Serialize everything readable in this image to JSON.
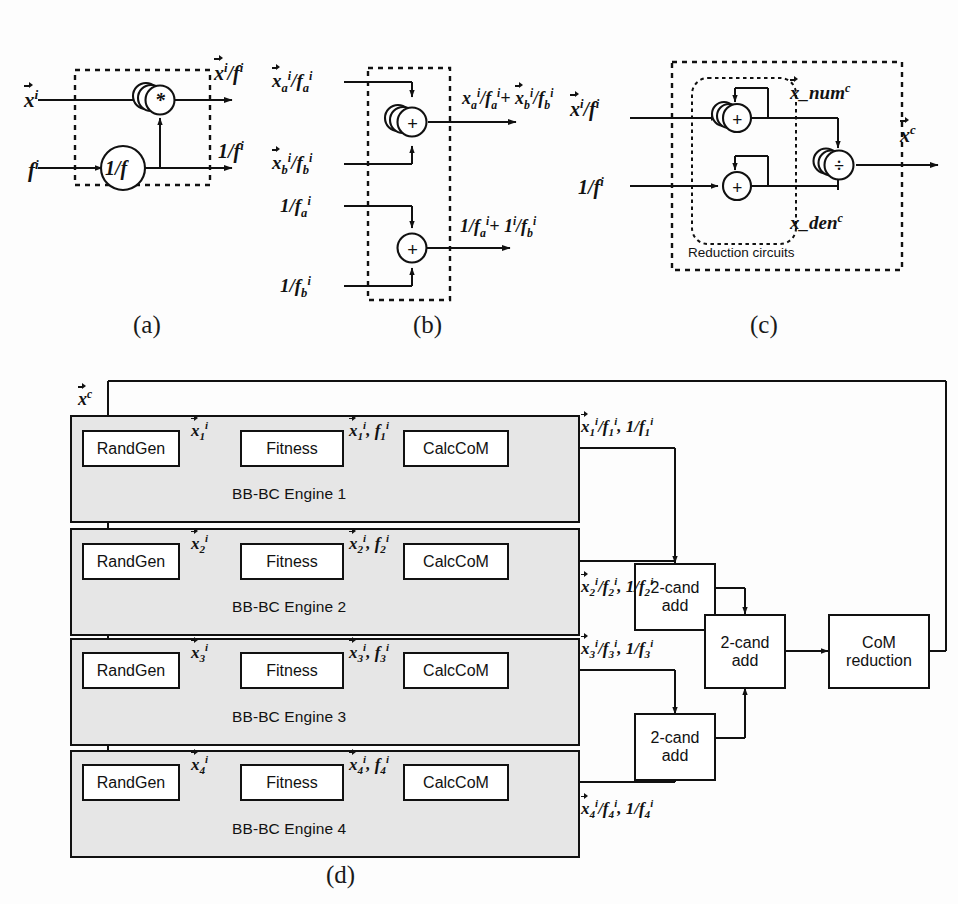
{
  "figure": {
    "panels": [
      {
        "id": "a",
        "caption": "(a)",
        "name": "calccom-unit",
        "inputs": [
          {
            "key": "x_i",
            "text": "x",
            "sup": "i",
            "vector": true
          },
          {
            "key": "f_i",
            "text": "f",
            "sup": "i",
            "vector": false
          }
        ],
        "outputs": [
          {
            "key": "x_over_f",
            "text": "x",
            "sup": "i",
            "suffix": "/f",
            "sup2": "i",
            "vector": true
          },
          {
            "key": "one_over_f",
            "text": "1/f",
            "sup": "i",
            "vector": false
          }
        ],
        "blocks": [
          {
            "key": "recip",
            "label": "1/f",
            "shape": "circle"
          },
          {
            "key": "mult",
            "label": "*",
            "shape": "stacked-circle"
          }
        ]
      },
      {
        "id": "b",
        "caption": "(b)",
        "name": "two-candidate-adder",
        "inputs": [
          {
            "key": "xa_fa",
            "label": "xa/fa"
          },
          {
            "key": "xb_fb",
            "label": "xb/fb"
          },
          {
            "key": "inv_fa",
            "label": "1/fa"
          },
          {
            "key": "inv_fb",
            "label": "1/fb"
          }
        ],
        "outputs": [
          {
            "key": "sum_num",
            "label": "xa/fa + xb/fb"
          },
          {
            "key": "sum_den",
            "label": "1/fa + 1/fb"
          }
        ],
        "blocks": [
          {
            "key": "add_num",
            "label": "+",
            "shape": "stacked-circle"
          },
          {
            "key": "add_den",
            "label": "+",
            "shape": "circle"
          }
        ]
      },
      {
        "id": "c",
        "caption": "(c)",
        "name": "com-reduction-unit",
        "inner_label": "Reduction circuits",
        "inputs": [
          {
            "key": "x_over_f",
            "label": "x/f"
          },
          {
            "key": "one_over_f",
            "label": "1/f"
          }
        ],
        "internal_labels": [
          {
            "key": "x_num",
            "text": "x_num",
            "sup": "c",
            "vector": true
          },
          {
            "key": "x_den",
            "text": "x_den",
            "sup": "c",
            "vector": false
          }
        ],
        "outputs": [
          {
            "key": "x_c",
            "text": "x",
            "sup": "c",
            "vector": true
          }
        ],
        "blocks": [
          {
            "key": "acc_num",
            "label": "+",
            "shape": "stacked-circle"
          },
          {
            "key": "acc_den",
            "label": "+",
            "shape": "circle"
          },
          {
            "key": "div",
            "label": "÷",
            "shape": "stacked-circle"
          }
        ]
      },
      {
        "id": "d",
        "caption": "(d)",
        "name": "parallel-bbbc-architecture",
        "feedback_label": {
          "text": "x",
          "sup": "c",
          "vector": true
        },
        "engines": [
          {
            "name": "BB-BC Engine 1",
            "stages": [
              "RandGen",
              "Fitness",
              "CalcCoM"
            ],
            "edge1": {
              "base": "x",
              "sub": "1",
              "sup": "i"
            },
            "edge2": {
              "base": "x",
              "sub": "1",
              "sup": "i",
              "second": "f",
              "sub2": "1",
              "sup2": "i"
            },
            "out": {
              "num": "x",
              "sub": "1",
              "sup": "i",
              "den": "f",
              "sup_den": "i",
              "inv": "1/f",
              "inv_sub": "1",
              "inv_sup": "i"
            }
          },
          {
            "name": "BB-BC Engine 2",
            "stages": [
              "RandGen",
              "Fitness",
              "CalcCoM"
            ],
            "edge1": {
              "base": "x",
              "sub": "2",
              "sup": "i"
            },
            "edge2": {
              "base": "x",
              "sub": "2",
              "sup": "i",
              "second": "f",
              "sub2": "2",
              "sup2": "i"
            },
            "out": {
              "num": "x",
              "sub": "2",
              "sup": "i",
              "den": "f",
              "sup_den": "i",
              "inv": "1/f",
              "inv_sub": "2",
              "inv_sup": "i"
            }
          },
          {
            "name": "BB-BC Engine 3",
            "stages": [
              "RandGen",
              "Fitness",
              "CalcCoM"
            ],
            "edge1": {
              "base": "x",
              "sub": "3",
              "sup": "i"
            },
            "edge2": {
              "base": "x",
              "sub": "3",
              "sup": "i",
              "second": "f",
              "sub2": "3",
              "sup2": "i"
            },
            "out": {
              "num": "x",
              "sub": "3",
              "sup": "i",
              "den": "f",
              "sup_den": "i",
              "inv": "1/f",
              "inv_sub": "3",
              "inv_sup": "i"
            }
          },
          {
            "name": "BB-BC Engine 4",
            "stages": [
              "RandGen",
              "Fitness",
              "CalcCoM"
            ],
            "edge1": {
              "base": "x",
              "sub": "4",
              "sup": "i"
            },
            "edge2": {
              "base": "x",
              "sub": "4",
              "sup": "i",
              "second": "f",
              "sub2": "4",
              "sup2": "i"
            },
            "out": {
              "num": "x",
              "sub": "4",
              "sup": "i",
              "den": "f",
              "sup_den": "i",
              "inv": "1/f",
              "inv_sub": "4",
              "inv_sup": "i"
            }
          }
        ],
        "reduction_blocks": [
          {
            "key": "cand12",
            "label": "2-cand\nadd",
            "line1": "2-cand",
            "line2": "add"
          },
          {
            "key": "cand34",
            "label": "2-cand\nadd",
            "line1": "2-cand",
            "line2": "add"
          },
          {
            "key": "candfinal",
            "label": "2-cand\nadd",
            "line1": "2-cand",
            "line2": "add"
          }
        ],
        "com_reduction": {
          "line1": "CoM",
          "line2": "reduction"
        }
      }
    ]
  },
  "text": {
    "randgen": "RandGen",
    "fitness": "Fitness",
    "calccom": "CalcCoM",
    "two_cand_1": "2-cand",
    "two_cand_2": "add",
    "com_1": "CoM",
    "com_2": "reduction",
    "reduction_circuits": "Reduction circuits",
    "recip_block": "1/f",
    "mult_op": "*",
    "plus_op": "+",
    "div_op": "÷",
    "cap_a": "(a)",
    "cap_b": "(b)",
    "cap_c": "(c)",
    "cap_d": "(d)",
    "engine1": "BB-BC Engine 1",
    "engine2": "BB-BC Engine 2",
    "engine3": "BB-BC Engine 3",
    "engine4": "BB-BC Engine 4"
  },
  "colors": {
    "line": "#111111",
    "engine_fill": "#e6e6e6",
    "block_fill": "#ffffff",
    "page_bg": "#fdfdfd"
  }
}
